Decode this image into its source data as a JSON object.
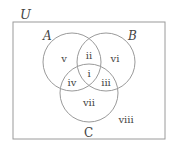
{
  "diagram": {
    "type": "venn",
    "universe_label": "U",
    "sets": [
      {
        "name": "A"
      },
      {
        "name": "B"
      },
      {
        "name": "C"
      }
    ],
    "regions": [
      {
        "label": "i",
        "description": "A ∩ B ∩ C"
      },
      {
        "label": "ii",
        "description": "A ∩ B only"
      },
      {
        "label": "iii",
        "description": "B ∩ C only"
      },
      {
        "label": "iv",
        "description": "A ∩ C only"
      },
      {
        "label": "v",
        "description": "A only"
      },
      {
        "label": "vi",
        "description": "B only"
      },
      {
        "label": "vii",
        "description": "C only"
      },
      {
        "label": "viii",
        "description": "outside A, B, C"
      }
    ],
    "colors": {
      "stroke": "#9a9a9a",
      "text": "#444444",
      "background": "#ffffff"
    }
  }
}
